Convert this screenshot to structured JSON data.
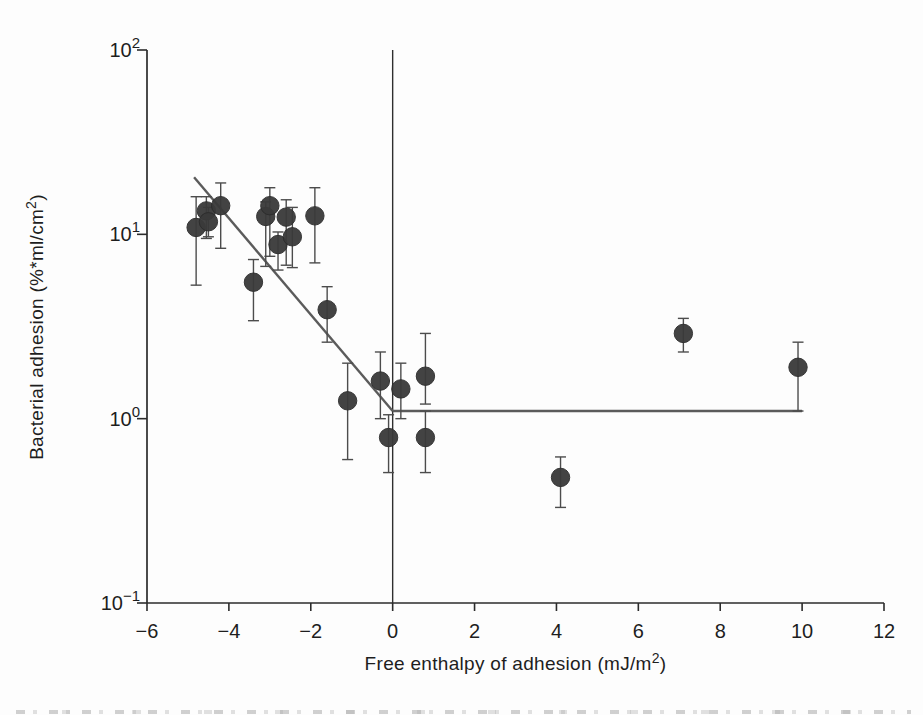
{
  "chart_data": {
    "type": "scatter",
    "title": "",
    "xlabel": "Free enthalpy of adhesion (mJ/m²)",
    "ylabel": "Bacterial adhesion (%*ml/cm²)",
    "xlabel_parts": {
      "main": "Free enthalpy of adhesion (mJ/m",
      "sup": "2",
      "end": ")"
    },
    "ylabel_parts": {
      "main": "Bacterial adhesion (%*ml/cm",
      "sup": "2",
      "end": ")"
    },
    "xlim": [
      -6,
      12
    ],
    "ylim": [
      0.1,
      100
    ],
    "yscale": "log",
    "grid": false,
    "legend": "none",
    "x_ticks": [
      {
        "value": -6,
        "label": "−6"
      },
      {
        "value": -4,
        "label": "−4"
      },
      {
        "value": -2,
        "label": "−2"
      },
      {
        "value": 0,
        "label": "0"
      },
      {
        "value": 2,
        "label": "2"
      },
      {
        "value": 4,
        "label": "4"
      },
      {
        "value": 6,
        "label": "6"
      },
      {
        "value": 8,
        "label": "8"
      },
      {
        "value": 10,
        "label": "10"
      },
      {
        "value": 12,
        "label": "12"
      }
    ],
    "y_ticks": [
      {
        "value": 100,
        "base": "10",
        "exp": "2"
      },
      {
        "value": 10,
        "base": "10",
        "exp": "1"
      },
      {
        "value": 1,
        "base": "10",
        "exp": "0"
      },
      {
        "value": 0.1,
        "base": "10",
        "exp": "−1"
      }
    ],
    "points": [
      {
        "x": -4.8,
        "y": 10.9,
        "err_lo": 5.3,
        "err_hi": 16.0
      },
      {
        "x": -4.55,
        "y": 13.4,
        "err_lo": 9.5,
        "err_hi": 16.0
      },
      {
        "x": -4.5,
        "y": 11.7,
        "err_lo": 9.7,
        "err_hi": 14.0
      },
      {
        "x": -4.2,
        "y": 14.3,
        "err_lo": 8.4,
        "err_hi": 19.0
      },
      {
        "x": -3.4,
        "y": 5.5,
        "err_lo": 3.4,
        "err_hi": 7.3
      },
      {
        "x": -3.1,
        "y": 12.5,
        "err_lo": 6.7,
        "err_hi": 15.0
      },
      {
        "x": -3.0,
        "y": 14.3,
        "err_lo": 7.6,
        "err_hi": 17.9
      },
      {
        "x": -2.8,
        "y": 8.8,
        "err_lo": 6.4,
        "err_hi": 10.3
      },
      {
        "x": -2.6,
        "y": 12.4,
        "err_lo": 6.8,
        "err_hi": 15.4
      },
      {
        "x": -2.45,
        "y": 9.7,
        "err_lo": 6.6,
        "err_hi": 14.0
      },
      {
        "x": -1.9,
        "y": 12.6,
        "err_lo": 7.0,
        "err_hi": 17.9
      },
      {
        "x": -1.6,
        "y": 3.9,
        "err_lo": 2.6,
        "err_hi": 5.2
      },
      {
        "x": -1.1,
        "y": 1.25,
        "err_lo": 0.6,
        "err_hi": 2.0
      },
      {
        "x": -0.3,
        "y": 1.6,
        "err_lo": 1.0,
        "err_hi": 2.3
      },
      {
        "x": 0.2,
        "y": 1.45,
        "err_lo": 1.0,
        "err_hi": 2.0
      },
      {
        "x": 0.8,
        "y": 1.7,
        "err_lo": 1.2,
        "err_hi": 2.9
      },
      {
        "x": -0.1,
        "y": 0.79,
        "err_lo": 0.51,
        "err_hi": 1.05
      },
      {
        "x": 0.8,
        "y": 0.79,
        "err_lo": 0.51,
        "err_hi": 1.1
      },
      {
        "x": 4.1,
        "y": 0.48,
        "err_lo": 0.33,
        "err_hi": 0.62
      },
      {
        "x": 7.1,
        "y": 2.9,
        "err_lo": 2.3,
        "err_hi": 3.5
      },
      {
        "x": 9.9,
        "y": 1.9,
        "err_lo": 1.1,
        "err_hi": 2.6
      }
    ],
    "fit_line": {
      "x1": -4.85,
      "y1": 20.4,
      "x2": 0,
      "y2": 1.1
    },
    "plateau_line": {
      "x1": 0,
      "x2": 10,
      "y": 1.1
    },
    "zero_line_x": 0
  },
  "colors": {
    "background": "#fdfdfd",
    "axis": "#2b2b2b",
    "text": "#1e1e1e",
    "fit_line": "#5b5b5b",
    "error_bar": "#4c4c4c",
    "point_fill": "#3a3a3a",
    "point_edge": "#2c2c2c",
    "zero_line": "#2f2f2f"
  }
}
